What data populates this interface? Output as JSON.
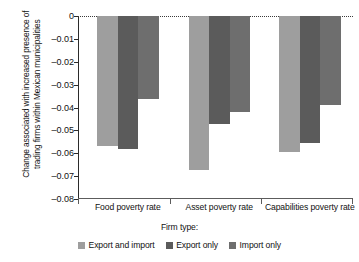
{
  "chart_data": {
    "type": "bar",
    "title": "",
    "xlabel": "Firm type:",
    "ylabel": "Change associated with increased presence of trading firms within Mexican municipalities",
    "categories": [
      "Food poverty rate",
      "Asset poverty rate",
      "Capabilities poverty rate"
    ],
    "series": [
      {
        "name": "Export and import",
        "color": "#9e9e9e",
        "values": [
          -0.0568,
          -0.0675,
          -0.0595
        ]
      },
      {
        "name": "Export only",
        "color": "#5b5b5b",
        "values": [
          -0.058,
          -0.047,
          -0.0557
        ]
      },
      {
        "name": "Import only",
        "color": "#6e6e6e",
        "values": [
          -0.0362,
          -0.042,
          -0.039
        ]
      }
    ],
    "ylim": [
      -0.08,
      0
    ],
    "yticks": [
      0,
      -0.01,
      -0.02,
      -0.03,
      -0.04,
      -0.05,
      -0.06,
      -0.07,
      -0.08
    ],
    "ytick_labels": [
      "0",
      "–0.01",
      "–0.02",
      "–0.03",
      "–0.04",
      "–0.05",
      "–0.06",
      "–0.07",
      "–0.08"
    ],
    "grid": false,
    "zero_reference_line": true,
    "legend_position": "bottom"
  },
  "axis": {
    "y_title": "Change associated with increased presence of trading firms within Mexican municipalities"
  },
  "legend": {
    "title": "Firm type:",
    "entries": [
      "Export and import",
      "Export only",
      "Import only"
    ]
  }
}
